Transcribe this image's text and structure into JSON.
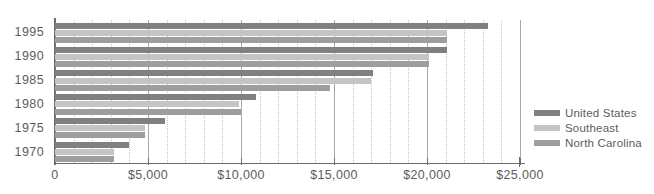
{
  "chart_data": {
    "type": "bar",
    "orientation": "horizontal",
    "title": "",
    "xlabel": "",
    "ylabel": "",
    "categories": [
      "1995",
      "1990",
      "1985",
      "1980",
      "1975",
      "1970"
    ],
    "series": [
      {
        "name": "United States",
        "color": "#808080",
        "values": [
          23300,
          21100,
          17100,
          10800,
          5900,
          4000
        ]
      },
      {
        "name": "Southeast",
        "color": "#c4c4c4",
        "values": [
          21100,
          20100,
          17000,
          9900,
          4850,
          3150
        ]
      },
      {
        "name": "North Carolina",
        "color": "#9e9e9e",
        "values": [
          21100,
          20100,
          14800,
          10000,
          4850,
          3150
        ]
      }
    ],
    "xlim": [
      0,
      25000
    ],
    "xticks": [
      0,
      5000,
      10000,
      15000,
      20000,
      25000
    ],
    "xticklabels": [
      "0",
      "$5,000",
      "$10,000",
      "$15,000",
      "$20,000",
      "$25,000"
    ],
    "minor_tick_step": 1000,
    "grid": {
      "major_vertical": true,
      "minor_vertical": true,
      "minor_style": "dotted",
      "horizontal": false
    },
    "legend": {
      "position": "right",
      "entries": [
        "United States",
        "Southeast",
        "North Carolina"
      ]
    }
  },
  "colors": {
    "united_states": "#808080",
    "southeast": "#c4c4c4",
    "north_carolina": "#9e9e9e",
    "axis": "#6e6e6e",
    "gridline_major": "#a8a8a8",
    "gridline_minor": "#c2c2c2",
    "text": "#5c5c5c",
    "background": "#ffffff"
  }
}
